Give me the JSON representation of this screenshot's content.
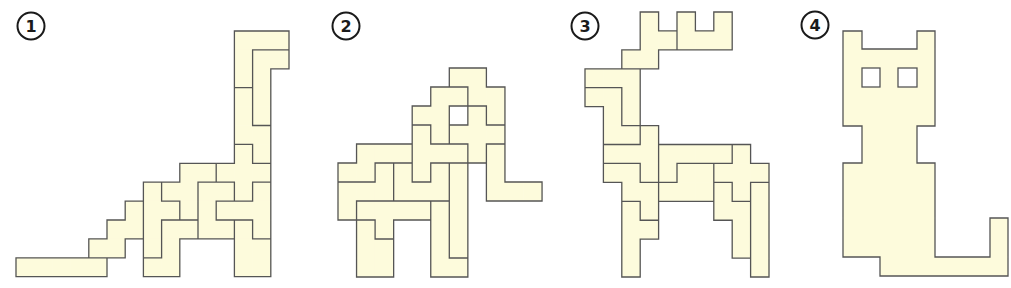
{
  "style": {
    "fill": "#fdfbdc",
    "stroke": "#555555",
    "badge_stroke": "#1a1a1a",
    "background": "#ffffff"
  },
  "figures": [
    {
      "label": "1",
      "subject": "dinosaur",
      "badge": {
        "cx": 31,
        "cy": 26,
        "r": 13.5
      },
      "grid": {
        "x0": 16,
        "y0": 31,
        "cw": 18.2,
        "ch": 18.9
      },
      "pieces": [
        [
          [
            12,
            0
          ],
          [
            13,
            0
          ],
          [
            14,
            0
          ],
          [
            12,
            1
          ],
          [
            12,
            2
          ]
        ],
        [
          [
            13,
            1
          ],
          [
            14,
            1
          ],
          [
            13,
            2
          ],
          [
            13,
            3
          ],
          [
            13,
            4
          ]
        ],
        [
          [
            12,
            3
          ],
          [
            12,
            4
          ],
          [
            12,
            5
          ],
          [
            13,
            5
          ],
          [
            13,
            6
          ]
        ],
        [
          [
            12,
            6
          ],
          [
            11,
            7
          ],
          [
            12,
            7
          ],
          [
            13,
            7
          ],
          [
            12,
            8
          ]
        ],
        [
          [
            9,
            7
          ],
          [
            10,
            7
          ],
          [
            8,
            8
          ],
          [
            9,
            8
          ],
          [
            9,
            9
          ]
        ],
        [
          [
            7,
            8
          ],
          [
            7,
            9
          ],
          [
            8,
            9
          ],
          [
            7,
            10
          ],
          [
            7,
            11
          ]
        ],
        [
          [
            8,
            10
          ],
          [
            9,
            10
          ],
          [
            8,
            11
          ],
          [
            7,
            12
          ],
          [
            8,
            12
          ]
        ],
        [
          [
            6,
            9
          ],
          [
            5,
            10
          ],
          [
            6,
            10
          ],
          [
            4,
            11
          ],
          [
            5,
            11
          ]
        ],
        [
          [
            0,
            12
          ],
          [
            1,
            12
          ],
          [
            2,
            12
          ],
          [
            3,
            12
          ],
          [
            4,
            12
          ]
        ],
        [
          [
            10,
            8
          ],
          [
            11,
            8
          ],
          [
            10,
            9
          ],
          [
            10,
            10
          ],
          [
            11,
            10
          ]
        ],
        [
          [
            13,
            8
          ],
          [
            11,
            9
          ],
          [
            12,
            9
          ],
          [
            13,
            9
          ],
          [
            13,
            10
          ]
        ],
        [
          [
            12,
            10
          ],
          [
            12,
            11
          ],
          [
            13,
            11
          ],
          [
            12,
            12
          ],
          [
            13,
            12
          ]
        ]
      ]
    },
    {
      "label": "2",
      "subject": "elephant",
      "badge": {
        "cx": 346,
        "cy": 26,
        "r": 13.5
      },
      "grid": {
        "x0": 338,
        "y0": 68,
        "cw": 18.55,
        "ch": 19.0
      },
      "pieces": [
        [
          [
            6,
            0
          ],
          [
            7,
            0
          ],
          [
            7,
            1
          ],
          [
            8,
            1
          ],
          [
            8,
            2
          ]
        ],
        [
          [
            5,
            1
          ],
          [
            6,
            1
          ],
          [
            4,
            2
          ],
          [
            5,
            2
          ],
          [
            5,
            3
          ]
        ],
        [
          [
            7,
            2
          ],
          [
            6,
            3
          ],
          [
            7,
            3
          ],
          [
            8,
            3
          ],
          [
            7,
            4
          ]
        ],
        [
          [
            8,
            4
          ],
          [
            8,
            5
          ],
          [
            8,
            6
          ],
          [
            9,
            6
          ],
          [
            10,
            6
          ]
        ],
        [
          [
            4,
            3
          ],
          [
            4,
            4
          ],
          [
            5,
            4
          ],
          [
            6,
            4
          ],
          [
            4,
            5
          ]
        ],
        [
          [
            6,
            5
          ],
          [
            6,
            6
          ],
          [
            6,
            7
          ],
          [
            6,
            8
          ],
          [
            6,
            9
          ]
        ],
        [
          [
            5,
            7
          ],
          [
            5,
            8
          ],
          [
            5,
            9
          ],
          [
            5,
            10
          ],
          [
            6,
            10
          ]
        ],
        [
          [
            5,
            5
          ],
          [
            3,
            5
          ],
          [
            3,
            6
          ],
          [
            4,
            6
          ],
          [
            5,
            6
          ]
        ],
        [
          [
            1,
            4
          ],
          [
            2,
            4
          ],
          [
            3,
            4
          ],
          [
            0,
            5
          ],
          [
            1,
            5
          ]
        ],
        [
          [
            2,
            5
          ],
          [
            0,
            6
          ],
          [
            1,
            6
          ],
          [
            2,
            6
          ],
          [
            0,
            7
          ]
        ],
        [
          [
            1,
            7
          ],
          [
            2,
            7
          ],
          [
            3,
            7
          ],
          [
            4,
            7
          ],
          [
            2,
            8
          ]
        ],
        [
          [
            1,
            8
          ],
          [
            1,
            9
          ],
          [
            2,
            9
          ],
          [
            1,
            10
          ],
          [
            2,
            10
          ]
        ]
      ]
    },
    {
      "label": "3",
      "subject": "deer",
      "badge": {
        "cx": 585,
        "cy": 26,
        "r": 13.5
      },
      "grid": {
        "x0": 585,
        "y0": 12,
        "cw": 18.4,
        "ch": 18.93
      },
      "pieces": [
        [
          [
            3,
            0
          ],
          [
            3,
            1
          ],
          [
            4,
            1
          ],
          [
            2,
            2
          ],
          [
            3,
            2
          ]
        ],
        [
          [
            5,
            0
          ],
          [
            5,
            1
          ],
          [
            6,
            1
          ],
          [
            7,
            1
          ],
          [
            7,
            0
          ]
        ],
        [
          [
            0,
            3
          ],
          [
            1,
            3
          ],
          [
            2,
            3
          ],
          [
            2,
            4
          ],
          [
            2,
            5
          ]
        ],
        [
          [
            0,
            4
          ],
          [
            1,
            4
          ],
          [
            1,
            5
          ],
          [
            1,
            6
          ],
          [
            2,
            6
          ]
        ],
        [
          [
            3,
            6
          ],
          [
            1,
            7
          ],
          [
            2,
            7
          ],
          [
            3,
            7
          ],
          [
            3,
            8
          ]
        ],
        [
          [
            1,
            8
          ],
          [
            2,
            8
          ],
          [
            2,
            9
          ],
          [
            3,
            9
          ],
          [
            3,
            10
          ]
        ],
        [
          [
            2,
            10
          ],
          [
            2,
            11
          ],
          [
            3,
            11
          ],
          [
            2,
            12
          ],
          [
            2,
            13
          ]
        ],
        [
          [
            4,
            7
          ],
          [
            5,
            7
          ],
          [
            6,
            7
          ],
          [
            7,
            7
          ],
          [
            4,
            8
          ]
        ],
        [
          [
            5,
            8
          ],
          [
            6,
            8
          ],
          [
            4,
            9
          ],
          [
            5,
            9
          ],
          [
            6,
            9
          ]
        ],
        [
          [
            8,
            7
          ],
          [
            7,
            8
          ],
          [
            8,
            8
          ],
          [
            9,
            8
          ],
          [
            8,
            9
          ]
        ],
        [
          [
            7,
            9
          ],
          [
            7,
            10
          ],
          [
            8,
            10
          ],
          [
            8,
            11
          ],
          [
            8,
            12
          ]
        ],
        [
          [
            9,
            9
          ],
          [
            9,
            10
          ],
          [
            9,
            11
          ],
          [
            9,
            12
          ],
          [
            9,
            13
          ]
        ]
      ]
    },
    {
      "label": "4",
      "subject": "cat",
      "badge": {
        "cx": 815,
        "cy": 25,
        "r": 13.5
      },
      "outline": [
        [
          843,
          31
        ],
        [
          862,
          31
        ],
        [
          862,
          49
        ],
        [
          917,
          49
        ],
        [
          917,
          31
        ],
        [
          935,
          31
        ],
        [
          935,
          126
        ],
        [
          917,
          126
        ],
        [
          917,
          163
        ],
        [
          935,
          163
        ],
        [
          935,
          257
        ],
        [
          990,
          257
        ],
        [
          990,
          218
        ],
        [
          1008,
          218
        ],
        [
          1008,
          276
        ],
        [
          880,
          276
        ],
        [
          880,
          257
        ],
        [
          843,
          257
        ],
        [
          843,
          163
        ],
        [
          862,
          163
        ],
        [
          862,
          126
        ],
        [
          843,
          126
        ]
      ],
      "holes": [
        {
          "name": "left-eye",
          "x": 862,
          "y": 68,
          "w": 18,
          "h": 19
        },
        {
          "name": "right-eye",
          "x": 898,
          "y": 68,
          "w": 19,
          "h": 19
        }
      ]
    }
  ]
}
